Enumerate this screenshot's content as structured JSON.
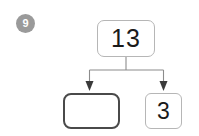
{
  "question": {
    "number": "9",
    "badge_color": "#9a9a9a",
    "badge_text_color": "#ffffff"
  },
  "diagram": {
    "type": "number-bond",
    "orientation": "top-down",
    "whole": {
      "label": "13",
      "value": 13,
      "filled": true,
      "border_color": "#b6b6b6"
    },
    "parts": [
      {
        "label": "",
        "value": null,
        "filled": false,
        "is_answer_blank": true,
        "border_color": "#4a4a4a"
      },
      {
        "label": "3",
        "value": 3,
        "filled": true,
        "is_answer_blank": false,
        "border_color": "#b6b6b6"
      }
    ],
    "connector_color": "#8c8c8c",
    "arrow_color": "#3a3a3a"
  },
  "canvas": {
    "background": "#ffffff"
  }
}
